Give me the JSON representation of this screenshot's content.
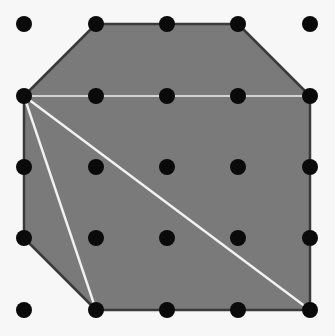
{
  "diagram": {
    "type": "geoboard-polygon",
    "background": "#f7f7f7",
    "grid": {
      "rows": 5,
      "cols": 5,
      "x": [
        24,
        96,
        167,
        238,
        310
      ],
      "y": [
        24,
        96,
        167,
        238,
        310
      ],
      "dot_radius": 8,
      "dot_color": "#0a0a0a"
    },
    "polygon": {
      "fill": "#7a7a7a",
      "stroke": "#3a3a3a",
      "vertices_grid": [
        [
          1,
          0
        ],
        [
          3,
          0
        ],
        [
          4,
          1
        ],
        [
          4,
          4
        ],
        [
          1,
          4
        ],
        [
          0,
          3
        ],
        [
          0,
          1
        ]
      ]
    },
    "diagonals": {
      "color": "#f2f2f2",
      "segments_grid": [
        [
          [
            0,
            1
          ],
          [
            4,
            1
          ]
        ],
        [
          [
            0,
            1
          ],
          [
            1,
            4
          ]
        ],
        [
          [
            0,
            1
          ],
          [
            4,
            4
          ]
        ]
      ]
    }
  }
}
